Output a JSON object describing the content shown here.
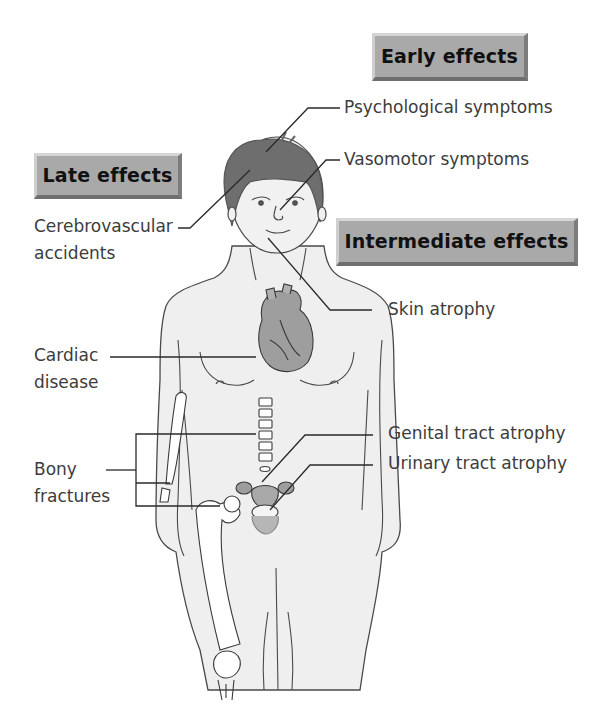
{
  "categories": {
    "early": "Early effects",
    "late": "Late effects",
    "intermediate": "Intermediate effects"
  },
  "labels": {
    "psychological": "Psychological symptoms",
    "vasomotor": "Vasomotor symptoms",
    "cerebrovascular_line1": "Cerebrovascular",
    "cerebrovascular_line2": "accidents",
    "skin": "Skin atrophy",
    "cardiac_line1": "Cardiac",
    "cardiac_line2": "disease",
    "genital": "Genital tract atrophy",
    "urinary": "Urinary tract atrophy",
    "bony_line1": "Bony",
    "bony_line2": "fractures"
  },
  "colors": {
    "badge_fill": "#a9a9a9",
    "skin_fill": "#efefef",
    "outline": "#4a4a4a",
    "hair": "#6e6e6e",
    "organ": "#9e9e9e",
    "leader": "#2a2a2a"
  }
}
